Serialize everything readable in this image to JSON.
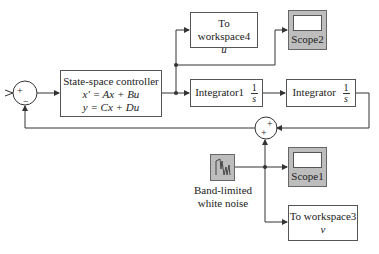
{
  "diagram": {
    "sum1": {
      "signs": [
        "+",
        "−"
      ]
    },
    "controller": {
      "title": "State-space controller",
      "eq1": "x′ = Ax + Bu",
      "eq2": "y = Cx + Du"
    },
    "to_workspace4": {
      "title": "To workspace4",
      "var": "u"
    },
    "scope2": {
      "label": "Scope2"
    },
    "integrator1": {
      "title": "Integrator1",
      "num": "1",
      "den": "s"
    },
    "integrator": {
      "title": "Integrator",
      "num": "1",
      "den": "s"
    },
    "sum2": {
      "signs": [
        "+",
        "+"
      ]
    },
    "noise": {
      "caption_line1": "Band-limited",
      "caption_line2": "white noise"
    },
    "scope1": {
      "label": "Scope1"
    },
    "to_workspace3": {
      "title": "To workspace3",
      "var": "v"
    }
  },
  "colors": {
    "scope_fill": "#bdbdbd",
    "line": "#333333",
    "background": "#ffffff"
  }
}
